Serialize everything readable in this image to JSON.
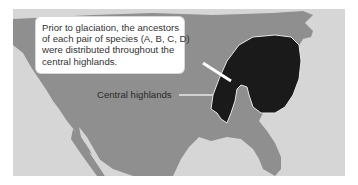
{
  "map": {
    "title": "Central highlands species distribution prior to glaciation",
    "colors": {
      "ocean": "#d6d6d6",
      "land": "#8f8f8f",
      "highlands_region": "#1a1a1a",
      "region_outline": "#e6e6e6",
      "callout_bg": "#ffffff",
      "text": "#333333"
    },
    "callout": {
      "lines": [
        "Prior to glaciation, the ancestors",
        "of each pair of species (A, B, C, D)",
        "were distributed throughout the",
        "central highlands."
      ]
    },
    "labels": {
      "central_highlands": "Central highlands"
    }
  }
}
